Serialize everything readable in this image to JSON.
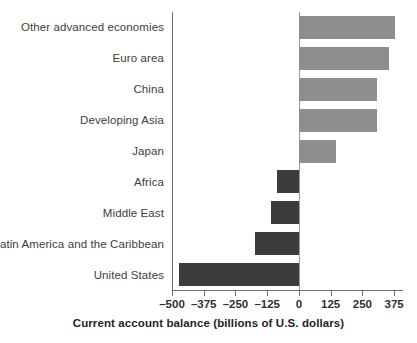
{
  "chart_data": {
    "type": "bar",
    "orientation": "horizontal",
    "title": "",
    "xlabel": "Current account balance (billions of U.S. dollars)",
    "ylabel": "",
    "categories": [
      "Other advanced economies",
      "Euro area",
      "China",
      "Developing Asia",
      "Japan",
      "Africa",
      "Middle East",
      "Latin America and the Caribbean",
      "United States"
    ],
    "values": [
      380,
      354,
      309,
      309,
      146,
      -88,
      -110,
      -174,
      -471
    ],
    "xlim": [
      -500,
      410
    ],
    "xticks": [
      -500,
      -375,
      -250,
      -125,
      0,
      125,
      250,
      375
    ],
    "xticklabels": [
      "–500",
      "–375",
      "–250",
      "–125",
      "0",
      "125",
      "250",
      "375"
    ],
    "grid": false,
    "legend": false,
    "colors": {
      "positive_bar": "#8e8e8e",
      "negative_bar": "#3c3c3c",
      "axis": "#6d6d6d",
      "zero_line": "#9a9a9a",
      "text": "#3d3d3d",
      "background": "#ffffff"
    }
  }
}
